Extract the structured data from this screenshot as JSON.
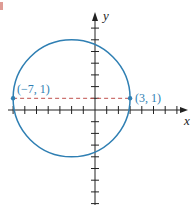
{
  "chart_data": {
    "type": "scatter",
    "title": "",
    "xlabel": "x",
    "ylabel": "y",
    "xlim": [
      -8,
      8
    ],
    "ylim": [
      -8,
      8
    ],
    "grid": false,
    "tick_step": 1,
    "circle": {
      "center": [
        -2,
        1
      ],
      "radius": 5,
      "color": "#2f7fb3"
    },
    "diameter_segment": {
      "from": [
        -7,
        1
      ],
      "to": [
        3,
        1
      ],
      "style": "dashed",
      "color": "#c0504d"
    },
    "points": [
      {
        "x": -7,
        "y": 1,
        "label": "(−7, 1)"
      },
      {
        "x": 3,
        "y": 1,
        "label": "(3, 1)"
      }
    ],
    "colors": {
      "axis": "#222222",
      "label": "#2f7fb3"
    }
  }
}
